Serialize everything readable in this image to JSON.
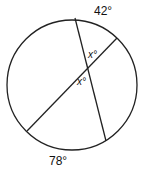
{
  "diagram": {
    "type": "circle-intersecting-chords",
    "arc_labels": {
      "top": "42°",
      "bottom": "78°"
    },
    "angle_labels": {
      "upper": "x°",
      "lower": "x°"
    }
  }
}
